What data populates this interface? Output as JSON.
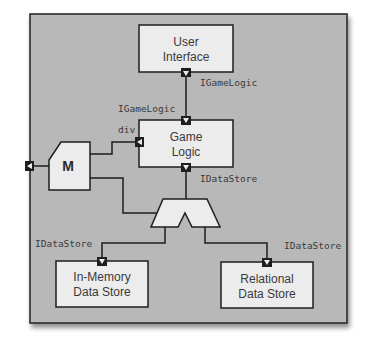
{
  "diagram": {
    "type": "component-diagram",
    "colors": {
      "frame_fill": "#b8b8b8",
      "frame_border": "#2b2b2b",
      "box_fill": "#ececec",
      "line": "#1e1e1e",
      "port_fill": "#1e1e1e"
    },
    "components": [
      {
        "id": "user-interface",
        "line1": "User",
        "line2": "Interface"
      },
      {
        "id": "game-logic",
        "line1": "Game",
        "line2": "Logic"
      },
      {
        "id": "in-memory-data-store",
        "line1": "In-Memory",
        "line2": "Data Store"
      },
      {
        "id": "relational-data-store",
        "line1": "Relational",
        "line2": "Data Store"
      }
    ],
    "mediator": {
      "id": "mediator",
      "label": "M"
    },
    "demux": {
      "id": "demux"
    },
    "interface_labels": {
      "ui_required": "IGameLogic",
      "gl_provided": "IGameLogic",
      "gl_div": "div",
      "gl_required": "IDataStore",
      "inmem_provided": "IDataStore",
      "relational_provided": "IDataStore"
    },
    "connections": [
      {
        "from": "User Interface",
        "to": "Game Logic",
        "interface": "IGameLogic"
      },
      {
        "from": "M",
        "to": "Game Logic",
        "interface": "div"
      },
      {
        "from": "Game Logic",
        "to": "demux",
        "interface": "IDataStore"
      },
      {
        "from": "M",
        "to": "demux"
      },
      {
        "from": "demux",
        "to": "In-Memory Data Store",
        "interface": "IDataStore"
      },
      {
        "from": "demux",
        "to": "Relational Data Store",
        "interface": "IDataStore"
      }
    ]
  }
}
